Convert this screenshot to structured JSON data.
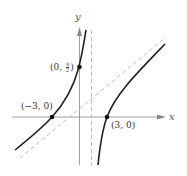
{
  "figure": {
    "axes": {
      "x_label": "x",
      "y_label": "y"
    },
    "points": [
      {
        "label_prefix": "(−3, 0)",
        "x": -3,
        "y": 0
      },
      {
        "label_prefix": "(0, ",
        "frac_num": "9",
        "frac_den": "2",
        "label_suffix": ")",
        "x": 0,
        "y": 4.5
      },
      {
        "label_prefix": "(3, 0)",
        "x": 3,
        "y": 0
      }
    ],
    "asymptotes": [
      {
        "type": "vertical",
        "style": "dashed"
      },
      {
        "type": "slant",
        "style": "dashed"
      }
    ],
    "colors": {
      "curve": "#222222",
      "axis": "#888888",
      "asymptote": "#aaaaaa",
      "point": "#111111"
    }
  }
}
